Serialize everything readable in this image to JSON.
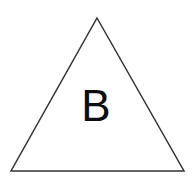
{
  "figure": {
    "type": "geometric-shape-diagram",
    "canvas": {
      "width": 192,
      "height": 177,
      "background_color": "#ffffff"
    },
    "shape": {
      "name": "triangle",
      "kind": "isosceles-triangle",
      "stroke_color": "#333333",
      "stroke_width": 1.5,
      "fill_color": "none",
      "vertices": [
        {
          "label": "apex",
          "x": 97,
          "y": 18
        },
        {
          "label": "bottom-right",
          "x": 184,
          "y": 171
        },
        {
          "label": "bottom-left",
          "x": 11,
          "y": 171
        }
      ],
      "points_attr": "97,18 184,171 11,171"
    },
    "label": {
      "text": "B",
      "color": "#0d0d0d",
      "font_size_px": 44,
      "center_x": 96,
      "center_y": 104
    }
  }
}
